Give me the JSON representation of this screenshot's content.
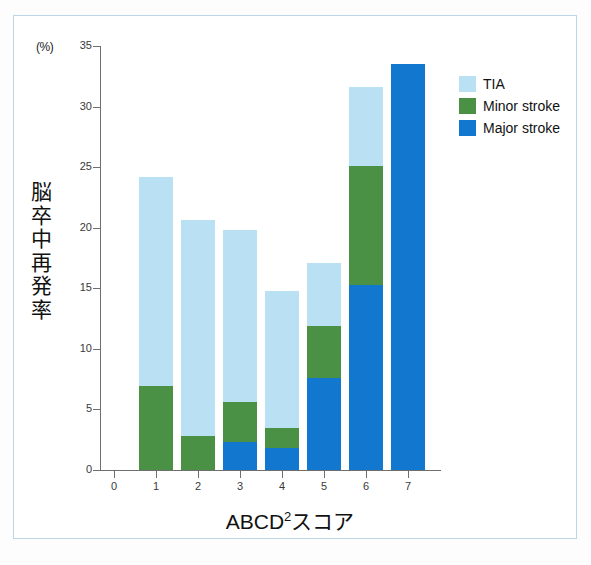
{
  "axis": {
    "y_unit": "(%)",
    "y_title": "脳卒中再発率",
    "x_title_main": "ABCD",
    "x_title_sup": "2",
    "x_title_tail": "スコア"
  },
  "legend": {
    "items": [
      {
        "label": "TIA",
        "color": "#b9e0f3"
      },
      {
        "label": "Minor stroke",
        "color": "#4a9145"
      },
      {
        "label": "Major stroke",
        "color": "#1277ce"
      }
    ]
  },
  "chart_data": {
    "type": "bar",
    "stacked": true,
    "title": "",
    "xlabel": "ABCD2スコア",
    "ylabel": "脳卒中再発率",
    "y_unit": "(%)",
    "categories": [
      "0",
      "1",
      "2",
      "3",
      "4",
      "5",
      "6",
      "7"
    ],
    "x_tick_labels": [
      "0",
      "1",
      "2",
      "3",
      "4",
      "5",
      "6",
      "7"
    ],
    "y_tick_labels": [
      "0",
      "5",
      "10",
      "15",
      "20",
      "25",
      "30",
      "35"
    ],
    "y_ticks": [
      0,
      5,
      10,
      15,
      20,
      25,
      30,
      35
    ],
    "ylim": [
      0,
      35
    ],
    "grid": false,
    "legend_position": "top-right",
    "series": [
      {
        "name": "Major stroke",
        "color": "#1277ce",
        "values": [
          0,
          0,
          0,
          2.3,
          1.8,
          7.6,
          15.3,
          33.5
        ]
      },
      {
        "name": "Minor stroke",
        "color": "#4a9145",
        "values": [
          0,
          6.9,
          2.8,
          5.6,
          3.5,
          11.9,
          25.1,
          33.5
        ]
      },
      {
        "name": "TIA",
        "color": "#b9e0f3",
        "values": [
          0,
          24.2,
          20.6,
          19.8,
          14.8,
          17.1,
          31.6,
          33.5
        ]
      }
    ],
    "cumulative_tops": {
      "note": "Each series value is the cumulative top of that stack layer",
      "total": [
        0,
        24.2,
        20.6,
        19.8,
        14.8,
        17.1,
        31.6,
        33.5
      ]
    }
  },
  "bars": [
    {
      "category": "1",
      "center_x": 156,
      "tia_top": 24.2,
      "minor_top": 6.9,
      "major_top": 0
    },
    {
      "category": "2",
      "center_x": 198,
      "tia_top": 20.6,
      "minor_top": 2.8,
      "major_top": 0
    },
    {
      "category": "3",
      "center_x": 240,
      "tia_top": 19.8,
      "minor_top": 5.6,
      "major_top": 2.3
    },
    {
      "category": "4",
      "center_x": 282,
      "tia_top": 14.8,
      "minor_top": 3.5,
      "major_top": 1.8
    },
    {
      "category": "5",
      "center_x": 324,
      "tia_top": 17.1,
      "minor_top": 11.9,
      "major_top": 7.6
    },
    {
      "category": "6",
      "center_x": 366,
      "tia_top": 31.6,
      "minor_top": 25.1,
      "major_top": 15.3
    },
    {
      "category": "7",
      "center_x": 408,
      "tia_top": 33.5,
      "minor_top": 33.5,
      "major_top": 33.5
    }
  ]
}
